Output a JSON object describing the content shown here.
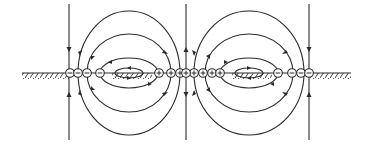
{
  "diagram": {
    "type": "electric-field-lines",
    "colors": {
      "ink": "#2a2a2a",
      "background": "#ffffff"
    },
    "ground": {
      "y": 73,
      "segments": [
        [
          22,
          68
        ],
        [
          292,
          350
        ]
      ],
      "hatched": true
    },
    "vertical_lines": [
      {
        "x": 69,
        "y1": 4,
        "y2": 140,
        "arrows": "toward-ground"
      },
      {
        "x": 186,
        "y1": 4,
        "y2": 140,
        "arrows": "away-from-ground"
      },
      {
        "x": 309,
        "y1": 4,
        "y2": 140,
        "arrows": "toward-ground"
      }
    ],
    "cells": [
      {
        "name": "left-cell",
        "center_x": 129,
        "negative_charges_x": [
          70,
          78,
          87,
          100
        ],
        "positive_charges_x": [
          159,
          171,
          180
        ],
        "flow": "from positive (right) to negative (left)"
      },
      {
        "name": "right-cell",
        "center_x": 249,
        "positive_charges_x": [
          194,
          203,
          212,
          220
        ],
        "negative_charges_x": [
          278,
          292,
          301
        ],
        "flow": "from positive (left) to negative (right)"
      }
    ],
    "center_charge": {
      "x": 186,
      "sign": "+"
    },
    "edge_charges": [
      {
        "x": 309,
        "sign": "-"
      }
    ],
    "legend": {
      "negative_symbol": "−",
      "positive_symbol": "+"
    }
  }
}
